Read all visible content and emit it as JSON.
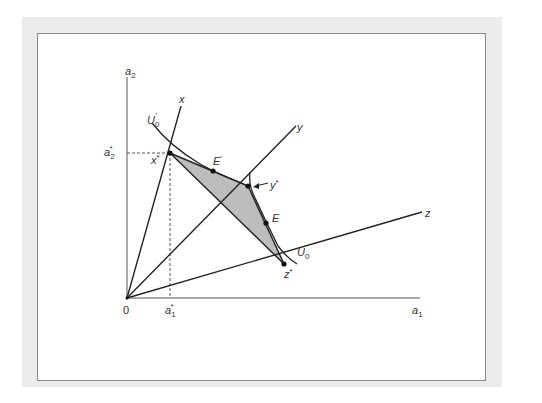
{
  "diagram": {
    "type": "indifference-curve characteristics diagram",
    "axes": {
      "x_label": "a",
      "x_label_sub": "1",
      "y_label": "a",
      "y_label_sub": "2",
      "origin_label": "0",
      "x_tick_label": "a",
      "x_tick_sub": "1",
      "x_tick_sup": "*",
      "y_tick_label": "a",
      "y_tick_sub": "2",
      "y_tick_sup": "*"
    },
    "rays": [
      {
        "name": "x",
        "label": "x"
      },
      {
        "name": "y",
        "label": "y"
      },
      {
        "name": "z",
        "label": "z"
      }
    ],
    "points": {
      "x_star": {
        "label": "x",
        "sup": "*"
      },
      "y_star": {
        "label": "y",
        "sup": "*"
      },
      "z_star": {
        "label": "z",
        "sup": "*"
      },
      "E": {
        "label": "E"
      },
      "E_prime": {
        "label": "E",
        "sup": "′"
      }
    },
    "curves": {
      "U0": {
        "label": "U",
        "sub": "0"
      },
      "U0_prime": {
        "label": "U",
        "sub": "0",
        "sup": "′"
      }
    },
    "colors": {
      "line": "#222222",
      "shade": "#bdbdbd",
      "frame": "#ebebeb",
      "dashed": "#555555"
    }
  }
}
